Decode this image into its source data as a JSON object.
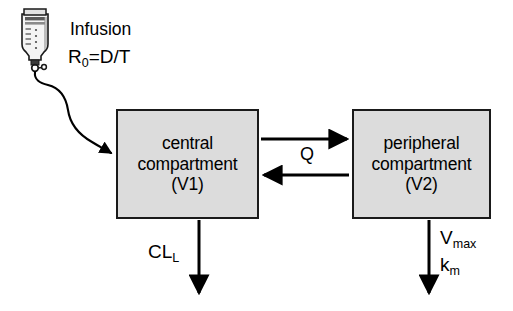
{
  "diagram": {
    "colors": {
      "box_fill": "#dcdcdc",
      "box_border": "#1a1a1a",
      "stroke": "#000000",
      "background": "#ffffff"
    },
    "infusion": {
      "source_icon": "iv-bottle-icon",
      "label": "Infusion",
      "rate_symbol": "R",
      "rate_subscript": "0",
      "rate_expression": "=D/T"
    },
    "compartments": [
      {
        "id": "central",
        "line1": "central",
        "line2": "compartment",
        "line3": "(V1)"
      },
      {
        "id": "peripheral",
        "line1": "peripheral",
        "line2": "compartment",
        "line3": "(V2)"
      }
    ],
    "flows": {
      "intercompartmental_label": "Q",
      "forward_arrow": "central-to-peripheral-arrow",
      "reverse_arrow": "peripheral-to-central-arrow"
    },
    "eliminations": [
      {
        "id": "hepatic-clearance",
        "symbol": "CL",
        "subscript": "L"
      },
      {
        "id": "michaelis-menten-vmax",
        "symbol": "V",
        "subscript": "max"
      },
      {
        "id": "michaelis-menten-km",
        "symbol": "k",
        "subscript": "m"
      }
    ]
  }
}
